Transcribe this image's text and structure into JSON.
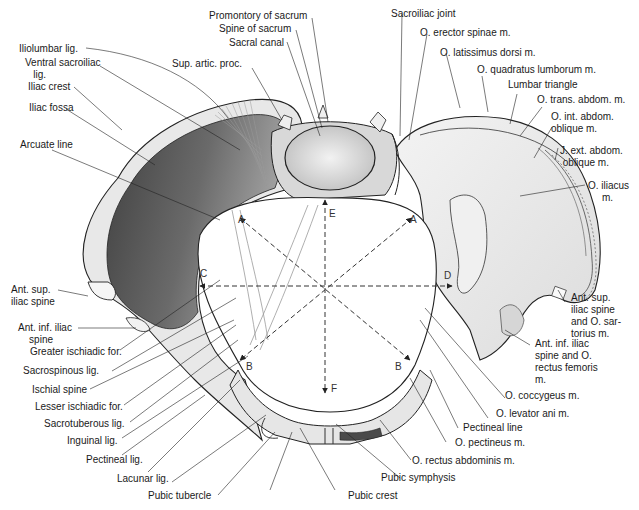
{
  "figure": {
    "colors": {
      "bone_light": "#ececec",
      "bone_mid": "#c9c9c9",
      "iliac_fossa_dark": "#5a5a5a",
      "line": "#222222",
      "background": "#ffffff"
    }
  },
  "labels_left": {
    "iliolumbar_lig": "Iliolumbar lig.",
    "ventral_sacroiliac_lig": "Ventral sacroiliac\n   lig.",
    "iliac_crest": "Iliac crest",
    "iliac_fossa": "Iliac fossa",
    "arcuate_line": "Arcuate line",
    "ant_sup_iliac_spine": "Ant. sup.\niliac spine",
    "ant_inf_iliac_spine": "Ant. inf. iliac\n    spine",
    "greater_ischiadic_for": "Greater ischiadic for.",
    "sacrospinous_lig": "Sacrospinous lig.",
    "ischial_spine": "Ischial spine",
    "lesser_ischiadic_for": "Lesser ischiadic for.",
    "sacrotuberous_lig": "Sacrotuberous lig.",
    "inguinal_lig": "Inguinal lig.",
    "pectineal_lig": "Pectineal lig.",
    "lacunar_lig": "Lacunar lig.",
    "pubic_tubercle": "Pubic tubercle"
  },
  "labels_top": {
    "promontory_of_sacrum": "Promontory of sacrum",
    "spine_of_sacrum": "Spine of sacrum",
    "sacral_canal": "Sacral canal",
    "sup_artic_proc": "Sup. artic. proc.",
    "sacroiliac_joint": "Sacroiliac joint",
    "o_erector_spinae": "O. erector spinae m.",
    "o_latissimus_dorsi": "O. latissimus dorsi m.",
    "o_quadratus_lumborum": "O. quadratus lumborum m.",
    "lumbar_triangle": "Lumbar triangle",
    "o_trans_abdom": "O. trans. abdom. m."
  },
  "labels_right": {
    "o_int_abdom_oblique": "O. int. abdom.\noblique m.",
    "o_ext_abdom_oblique": "J. ext. abdom.\n oblique m.",
    "o_iliacus": "O. iliacus\n     m.",
    "ant_sup_iliac_spine_sartorius": "Ant. sup.\niliac spine\nand O. sar-\ntorius m.",
    "ant_inf_iliac_spine_rectus_femoris": "Ant. inf. iliac\nspine and O.\nrectus femoris\nm.",
    "o_coccygeus": "O. coccygeus m.",
    "o_levator_ani": "O. levator ani m.",
    "pectineal_line": "Pectineal line",
    "o_pectineus": "O. pectineus m.",
    "o_rectus_abdominis": "O. rectus abdominis m."
  },
  "labels_bottom": {
    "pubic_symphysis": "Pubic symphysis",
    "pubic_crest": "Pubic crest"
  },
  "diameter_letters": {
    "A_left": "A",
    "A_right": "A",
    "B_left": "B",
    "B_right": "B",
    "C": "C",
    "D": "D",
    "E": "E",
    "F": "F"
  }
}
